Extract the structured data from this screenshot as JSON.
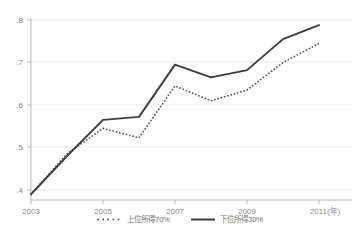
{
  "chart_data": {
    "type": "line",
    "title": "",
    "subtitle": "",
    "xlabel": "",
    "ylabel": "",
    "x_unit_note": "(年)",
    "x": [
      2003,
      2004,
      2005,
      2006,
      2007,
      2008,
      2009,
      2010,
      2011
    ],
    "xlim": [
      2003,
      2011
    ],
    "ylim": [
      0.355,
      0.805
    ],
    "xticks": [
      2003,
      2005,
      2007,
      2011
    ],
    "xtick_labels": [
      "2003",
      "2005",
      "2007",
      "2009",
      "2011(年)"
    ],
    "xticks_all": [
      2003,
      2005,
      2007,
      2009,
      2011
    ],
    "yticks": [
      0.4,
      0.5,
      0.6,
      0.7,
      0.8
    ],
    "ytick_labels": [
      ".4",
      ".5",
      ".6",
      ".7",
      ".8"
    ],
    "grid": true,
    "grid_axis": "y",
    "legend_position": "bottom-center",
    "series": [
      {
        "name": "上位所得70%",
        "style": "dotted",
        "color": "#595959",
        "values": [
          0.39,
          0.485,
          0.545,
          0.523,
          0.645,
          0.61,
          0.635,
          0.7,
          0.745
        ]
      },
      {
        "name": "下位所得30%",
        "style": "solid",
        "color": "#3d3d3d",
        "values": [
          0.39,
          0.48,
          0.565,
          0.572,
          0.695,
          0.665,
          0.682,
          0.755,
          0.788
        ]
      }
    ]
  },
  "legend": {
    "entries": [
      {
        "label": "上位所得70%",
        "style": "dotted"
      },
      {
        "label": "下位所得30%",
        "style": "solid"
      }
    ]
  },
  "axis": {
    "y_labels": [
      ".8",
      ".7",
      ".6",
      ".5",
      ".4"
    ],
    "x_labels": [
      "2003",
      "2005",
      "2007",
      "2009",
      "2011(年)"
    ]
  },
  "colors": {
    "series_dotted": "#595959",
    "series_solid": "#3d3d3d",
    "grid": "#eeeeee",
    "axis": "#b4b4b4",
    "tick_text": "#8a8a8a",
    "legend_text": "#6f6f6f",
    "background": "#ffffff"
  }
}
